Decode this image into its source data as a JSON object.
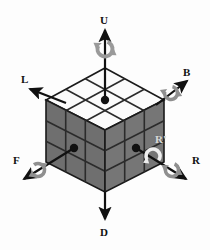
{
  "figure": {
    "kind": "rubiks-cube-axis-diagram",
    "background_color": "#fdfdfd"
  },
  "cube": {
    "size": 3,
    "top_face_color": "#fbfbfb",
    "left_face_color": "#6f6f6f",
    "right_face_color": "#767676",
    "grid_line_color": "#2b2b2b",
    "outline_color": "#1a1a1a",
    "center_dot_color": "#111111",
    "vertices": {
      "top": [
        105,
        68
      ],
      "left": [
        46,
        100
      ],
      "right": [
        164,
        100
      ],
      "bottom": [
        105,
        192
      ],
      "front": [
        105,
        130
      ],
      "left_bottom": [
        46,
        162
      ],
      "right_bottom": [
        164,
        162
      ]
    }
  },
  "axes": [
    {
      "id": "U",
      "label": "U",
      "name": "up-face",
      "arrow_color": "#111111",
      "has_rotation_marker": true,
      "rotation_marker_color": "#9a9a9a",
      "rotation_direction": "clockwise",
      "from": [
        105,
        100
      ],
      "to": [
        105,
        28
      ],
      "marker_at": [
        105,
        49
      ]
    },
    {
      "id": "D",
      "label": "D",
      "name": "down-face",
      "arrow_color": "#111111",
      "has_rotation_marker": false,
      "rotation_marker_color": "#9a9a9a",
      "rotation_direction": "",
      "from": [
        105,
        192
      ],
      "to": [
        105,
        221
      ],
      "marker_at": [
        0,
        0
      ]
    },
    {
      "id": "L",
      "label": "L",
      "name": "left-face",
      "arrow_color": "#111111",
      "has_rotation_marker": false,
      "rotation_marker_color": "#9a9a9a",
      "rotation_direction": "",
      "from": [
        63,
        101
      ],
      "to": [
        28,
        88
      ],
      "marker_at": [
        0,
        0
      ]
    },
    {
      "id": "B",
      "label": "B",
      "name": "back-face",
      "arrow_color": "#111111",
      "has_rotation_marker": true,
      "rotation_marker_color": "#9a9a9a",
      "rotation_direction": "clockwise",
      "from": [
        157,
        103
      ],
      "to": [
        189,
        80
      ],
      "marker_at": [
        172,
        92
      ]
    },
    {
      "id": "F",
      "label": "F",
      "name": "front-face",
      "arrow_color": "#111111",
      "has_rotation_marker": true,
      "rotation_marker_color": "#9a9a9a",
      "rotation_direction": "clockwise",
      "from": [
        74,
        148
      ],
      "to": [
        22,
        180
      ],
      "marker_at": [
        38,
        170
      ]
    },
    {
      "id": "R",
      "label": "R",
      "name": "right-face",
      "arrow_color": "#111111",
      "has_rotation_marker": true,
      "rotation_marker_color": "#9a9a9a",
      "rotation_direction": "clockwise",
      "from": [
        136,
        148
      ],
      "to": [
        188,
        180
      ],
      "marker_at": [
        172,
        170
      ]
    },
    {
      "id": "Rprime",
      "label": "R'",
      "name": "right-face-prime",
      "arrow_color": "#111111",
      "has_rotation_marker": true,
      "rotation_marker_color": "#efefef",
      "rotation_direction": "counter-clockwise",
      "from": [
        0,
        0
      ],
      "to": [
        0,
        0
      ],
      "marker_at": [
        153,
        155
      ]
    }
  ],
  "center_dots": [
    {
      "name": "up-center-dot",
      "at": [
        105,
        100
      ]
    },
    {
      "name": "front-center-dot",
      "at": [
        74,
        148
      ]
    },
    {
      "name": "right-center-dot",
      "at": [
        136,
        148
      ]
    }
  ]
}
